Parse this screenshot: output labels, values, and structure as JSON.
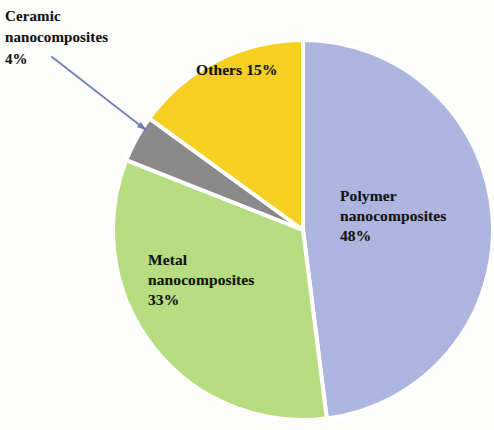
{
  "figure": {
    "background_color": "#fdfdfc",
    "pie": {
      "center_x": 303,
      "center_y": 230,
      "radius": 190,
      "start_angle_deg": 0,
      "direction": "clockwise",
      "separator_color": "#ffffff",
      "separator_width": 4
    }
  },
  "chart_data": {
    "type": "pie",
    "title": "",
    "subtitle": "",
    "xlabel": "",
    "ylabel": "",
    "legend_position": "none",
    "grid": false,
    "units": "percent",
    "total": 100,
    "categories": [
      "Polymer nanocomposites",
      "Metal nanocomposites",
      "Ceramic nanocomposites",
      "Others"
    ],
    "values": [
      48,
      33,
      4,
      15
    ],
    "colors": [
      "#aeb6e0",
      "#b6de80",
      "#8a8a8a",
      "#f6d022"
    ],
    "slices": [
      {
        "name": "Polymer nanocomposites",
        "value": 48,
        "label": "Polymer\nnanocomposites\n48%",
        "percent_text": "48%",
        "color": "#aeb6e0",
        "start_angle_deg": 0,
        "end_angle_deg": 172.8,
        "label_placement": "inside"
      },
      {
        "name": "Metal nanocomposites",
        "value": 33,
        "label": "Metal\nnanocomposites\n33%",
        "percent_text": "33%",
        "color": "#b6de80",
        "start_angle_deg": 172.8,
        "end_angle_deg": 291.6,
        "label_placement": "inside"
      },
      {
        "name": "Ceramic nanocomposites",
        "value": 4,
        "label": "Ceramic\nnanocomposites\n4%",
        "percent_text": "4%",
        "color": "#8a8a8a",
        "start_angle_deg": 291.6,
        "end_angle_deg": 306.0,
        "label_placement": "outside-with-leader"
      },
      {
        "name": "Others",
        "value": 15,
        "label": "Others 15%",
        "percent_text": "15%",
        "color": "#f6d022",
        "start_angle_deg": 306.0,
        "end_angle_deg": 360.0,
        "label_placement": "inside"
      }
    ],
    "annotations": [
      {
        "name": "ceramic-leader-arrow",
        "text": "Ceramic\nnanocomposites\n4%",
        "points_to": "Ceramic nanocomposites",
        "line_color": "#6b76ac",
        "from_x": 52,
        "from_y": 57,
        "to_x": 146,
        "to_y": 130
      }
    ]
  }
}
